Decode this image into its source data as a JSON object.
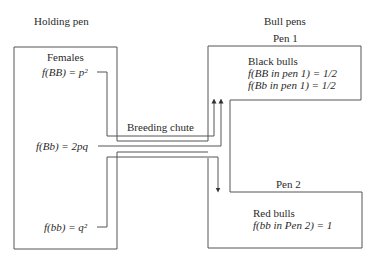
{
  "headers": {
    "left": "Holding pen",
    "right": "Bull pens"
  },
  "holding_pen": {
    "title": "Females",
    "genotypes": [
      {
        "label": "f(BB) = p²"
      },
      {
        "label": "f(Bb) = 2pq"
      },
      {
        "label": "f(bb) = q²"
      }
    ]
  },
  "chute": {
    "label": "Breeding chute"
  },
  "pen1": {
    "title": "Pen 1",
    "group": "Black bulls",
    "lines": [
      "f(BB in pen 1) = 1/2",
      "f(Bb in pen 1) = 1/2"
    ]
  },
  "pen2": {
    "title": "Pen 2",
    "group": "Red bulls",
    "lines": [
      "f(bb in Pen 2) = 1"
    ]
  },
  "colors": {
    "line": "#555555",
    "text": "#2a2a2a",
    "background": "#ffffff"
  }
}
